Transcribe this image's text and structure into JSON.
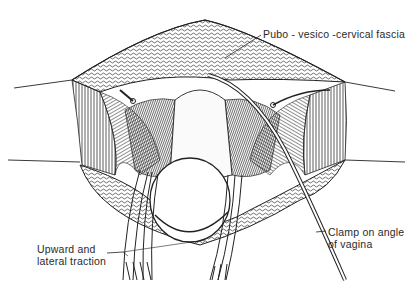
{
  "figure": {
    "type": "surgical illustration",
    "labels": {
      "fascia": "Pubo - vesico -cervical  fascia",
      "traction_line1": "Upward  and",
      "traction_line2": "lateral  traction",
      "clamp_line1": "Clamp  on  angle",
      "clamp_line2": "of  vagina"
    }
  },
  "colors": {
    "ink": "#1a1a1a",
    "paper": "#ffffff",
    "shade": "#3a3a3a"
  }
}
